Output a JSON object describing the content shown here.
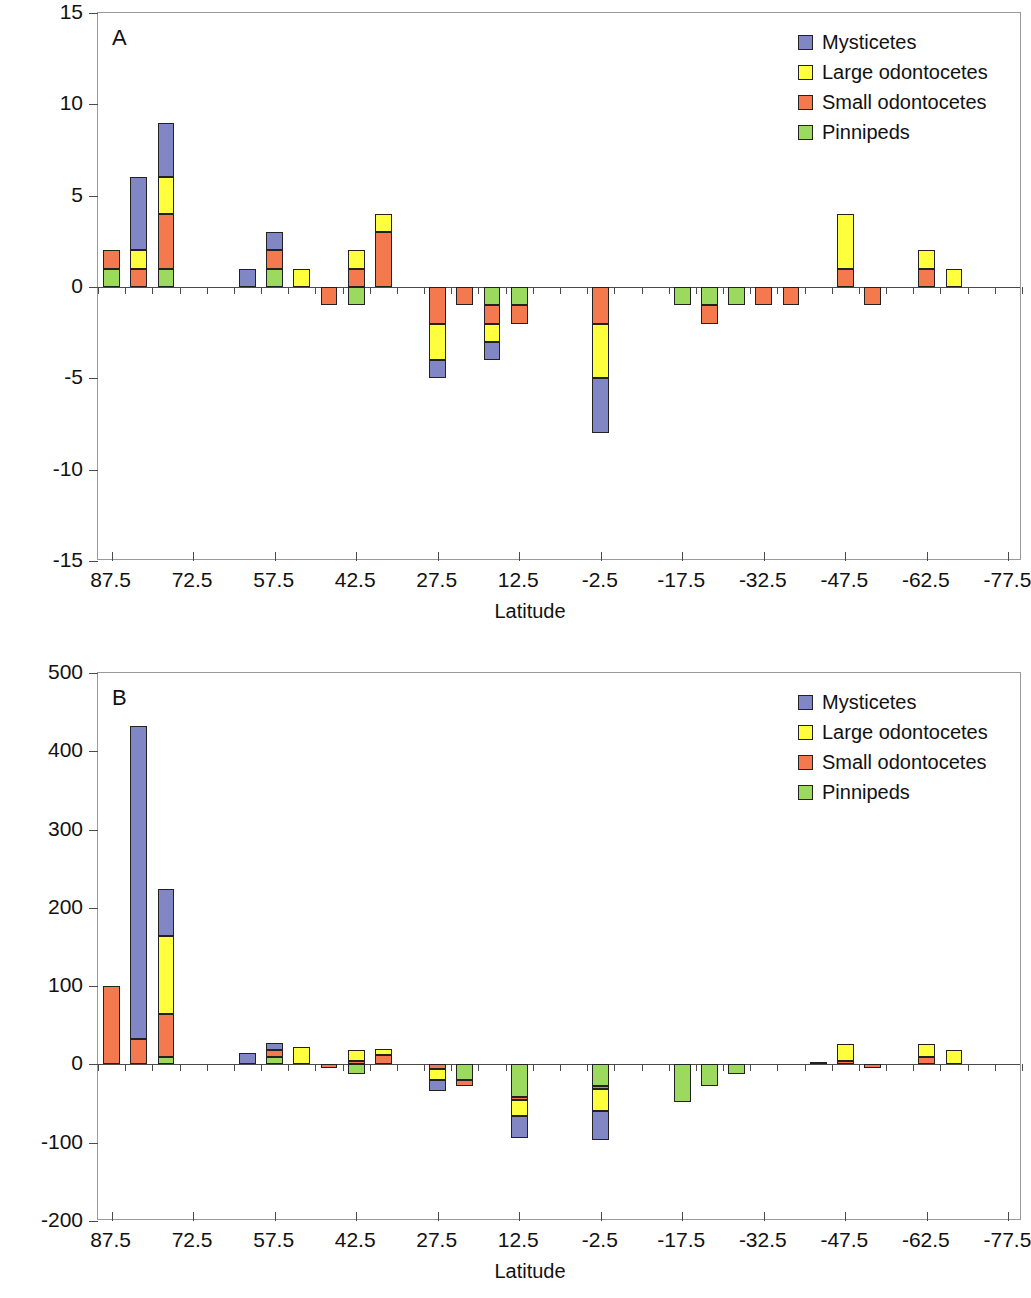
{
  "figure": {
    "series_colors": {
      "mysticetes": "#8186c4",
      "large_odontocetes": "#ffff3d",
      "small_odontocetes": "#f4794e",
      "pinnipeds": "#9bd95f"
    },
    "legend_labels": [
      "Mysticetes",
      "Large odontocetes",
      "Small odontocetes",
      "Pinnipeds"
    ]
  },
  "chart_data": [
    {
      "type": "bar",
      "stacked": true,
      "panel": "A",
      "title": "A",
      "xlabel": "Latitude",
      "ylabel": "Change in species richness [# of species]",
      "ylim": [
        -15,
        15
      ],
      "yticks": [
        15,
        10,
        5,
        0,
        -5,
        -10,
        -15
      ],
      "ytick_labels": [
        "15",
        "10",
        "5",
        "0",
        "-5",
        "-10",
        "-15"
      ],
      "xlim": [
        90,
        -80
      ],
      "xtick_labels": [
        "87.5",
        "72.5",
        "57.5",
        "42.5",
        "27.5",
        "12.5",
        "-2.5",
        "-17.5",
        "-32.5",
        "-47.5",
        "-62.5",
        "-77.5"
      ],
      "xtick_values": [
        87.5,
        72.5,
        57.5,
        42.5,
        27.5,
        12.5,
        -2.5,
        -17.5,
        -32.5,
        -47.5,
        -62.5,
        -77.5
      ],
      "grid": false,
      "legend_position": "top-right",
      "categories": [
        87.5,
        82.5,
        77.5,
        72.5,
        67.5,
        62.5,
        57.5,
        52.5,
        47.5,
        42.5,
        37.5,
        32.5,
        27.5,
        22.5,
        17.5,
        12.5,
        7.5,
        2.5,
        -2.5,
        -7.5,
        -12.5,
        -17.5,
        -22.5,
        -27.5,
        -32.5,
        -37.5,
        -42.5,
        -47.5,
        -52.5,
        -57.5,
        -62.5,
        -67.5,
        -72.5,
        -77.5
      ],
      "series": [
        {
          "name": "Mysticetes",
          "values": [
            0,
            4,
            3,
            0,
            0,
            1,
            1,
            0,
            0,
            0,
            0,
            0,
            -1,
            0,
            -1,
            0,
            0,
            0,
            -3,
            0,
            0,
            0,
            0,
            0,
            0,
            0,
            0,
            0,
            0,
            0,
            0,
            0,
            0,
            0
          ]
        },
        {
          "name": "Large odontocetes",
          "values": [
            0,
            1,
            2,
            0,
            0,
            0,
            0,
            1,
            0,
            1,
            1,
            0,
            -2,
            0,
            -1,
            0,
            0,
            0,
            -3,
            0,
            0,
            0,
            0,
            0,
            0,
            0,
            0,
            3,
            0,
            0,
            1,
            1,
            0,
            0
          ]
        },
        {
          "name": "Small odontocetes",
          "values": [
            1,
            1,
            3,
            0,
            0,
            0,
            1,
            0,
            -1,
            1,
            3,
            0,
            -2,
            -1,
            -1,
            -1,
            0,
            0,
            -2,
            0,
            0,
            0,
            -1,
            0,
            -1,
            -1,
            0,
            1,
            -1,
            0,
            1,
            0,
            0,
            0
          ]
        },
        {
          "name": "Pinnipeds",
          "values": [
            1,
            0,
            1,
            0,
            0,
            0,
            1,
            0,
            0,
            -1,
            0,
            0,
            0,
            0,
            -1,
            -1,
            0,
            0,
            0,
            0,
            0,
            -1,
            -1,
            -1,
            0,
            0,
            0,
            0,
            0,
            0,
            0,
            0,
            0,
            0
          ]
        }
      ]
    },
    {
      "type": "bar",
      "stacked": true,
      "panel": "B",
      "title": "B",
      "xlabel": "Latitude",
      "ylabel": "Change in species richness [# of species]",
      "ylim": [
        -200,
        500
      ],
      "yticks": [
        500,
        400,
        300,
        200,
        100,
        0,
        -100,
        -200
      ],
      "ytick_labels": [
        "500",
        "400",
        "300",
        "200",
        "100",
        "0",
        "-100",
        "-200"
      ],
      "xlim": [
        90,
        -80
      ],
      "xtick_labels": [
        "87.5",
        "72.5",
        "57.5",
        "42.5",
        "27.5",
        "12.5",
        "-2.5",
        "-17.5",
        "-32.5",
        "-47.5",
        "-62.5",
        "-77.5"
      ],
      "xtick_values": [
        87.5,
        72.5,
        57.5,
        42.5,
        27.5,
        12.5,
        -2.5,
        -17.5,
        -32.5,
        -47.5,
        -62.5,
        -77.5
      ],
      "grid": false,
      "legend_position": "top-right",
      "categories": [
        87.5,
        82.5,
        77.5,
        72.5,
        67.5,
        62.5,
        57.5,
        52.5,
        47.5,
        42.5,
        37.5,
        32.5,
        27.5,
        22.5,
        17.5,
        12.5,
        7.5,
        2.5,
        -2.5,
        -7.5,
        -12.5,
        -17.5,
        -22.5,
        -27.5,
        -32.5,
        -37.5,
        -42.5,
        -47.5,
        -52.5,
        -57.5,
        -62.5,
        -67.5,
        -72.5,
        -77.5
      ],
      "series": [
        {
          "name": "Mysticetes",
          "values": [
            0,
            400,
            60,
            0,
            0,
            14,
            10,
            0,
            0,
            0,
            0,
            0,
            -14,
            0,
            0,
            -28,
            0,
            0,
            -36,
            0,
            0,
            0,
            0,
            0,
            0,
            0,
            0,
            0,
            0,
            0,
            0,
            0,
            0,
            0
          ]
        },
        {
          "name": "Large odontocetes",
          "values": [
            0,
            0,
            100,
            0,
            0,
            0,
            0,
            22,
            0,
            14,
            8,
            0,
            -14,
            0,
            0,
            -20,
            0,
            0,
            -28,
            0,
            0,
            0,
            0,
            0,
            0,
            0,
            0,
            22,
            0,
            0,
            16,
            18,
            0,
            0
          ]
        },
        {
          "name": "Small odontocetes",
          "values": [
            100,
            32,
            54,
            0,
            0,
            0,
            8,
            0,
            -4,
            4,
            12,
            0,
            -6,
            -8,
            0,
            -4,
            0,
            0,
            -4,
            0,
            0,
            0,
            0,
            0,
            0,
            0,
            3,
            4,
            -4,
            0,
            10,
            0,
            0,
            0
          ]
        },
        {
          "name": "Pinnipeds",
          "values": [
            0,
            0,
            10,
            0,
            0,
            0,
            10,
            0,
            0,
            -12,
            0,
            0,
            0,
            -20,
            0,
            -42,
            0,
            0,
            -28,
            0,
            0,
            -48,
            -28,
            -12,
            0,
            0,
            0,
            0,
            0,
            0,
            0,
            0,
            0,
            0
          ]
        }
      ]
    }
  ]
}
